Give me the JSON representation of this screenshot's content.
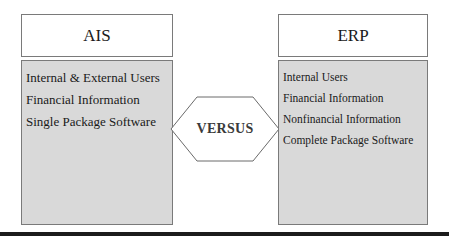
{
  "diagram": {
    "left_panel": {
      "title": "AIS",
      "items": [
        "Internal & External Users",
        "Financial Information",
        "Single Package Software"
      ]
    },
    "center": {
      "label": "VERSUS",
      "shape": "hexagon"
    },
    "right_panel": {
      "title": "ERP",
      "items": [
        "Internal Users",
        "Financial Information",
        "Nonfinancial Information",
        "Complete Package Software"
      ]
    },
    "colors": {
      "header_fill": "#ffffff",
      "body_fill": "#d9d9d9",
      "border": "#7a7a7a",
      "rule": "#1c1c1c"
    }
  }
}
